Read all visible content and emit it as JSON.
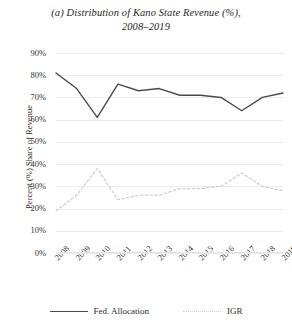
{
  "chart_data": {
    "type": "line",
    "title": "(a) Distribution of Kano State Revenue (%), 2008–2019",
    "title_line1": "(a) Distribution of Kano State Revenue (%),",
    "title_line2": "2008–2019",
    "xlabel": "",
    "ylabel": "Percent (%) Share of Revenue",
    "categories": [
      "2008",
      "2009",
      "2010",
      "2011",
      "2012",
      "2013",
      "2014",
      "2015",
      "2016",
      "2017",
      "2018",
      "2019"
    ],
    "x": [
      2008,
      2009,
      2010,
      2011,
      2012,
      2013,
      2014,
      2015,
      2016,
      2017,
      2018,
      2019
    ],
    "ylim": [
      0,
      90
    ],
    "yticks": [
      0,
      10,
      20,
      30,
      40,
      50,
      60,
      70,
      80,
      90
    ],
    "ytick_labels": [
      "0%",
      "10%",
      "20%",
      "30%",
      "40%",
      "50%",
      "60%",
      "70%",
      "80%",
      "90%"
    ],
    "grid": true,
    "grid_axis": "y",
    "legend_position": "bottom",
    "series": [
      {
        "name": "Fed. Allocation",
        "style": "solid",
        "color": "#4a4a4a",
        "values": [
          81,
          74,
          61,
          76,
          73,
          74,
          71,
          71,
          70,
          64,
          70,
          72
        ]
      },
      {
        "name": "IGR",
        "style": "dotted",
        "color": "#cfcfcf",
        "values": [
          19,
          26,
          38,
          24,
          26,
          26,
          29,
          29,
          30,
          36,
          30,
          28
        ]
      }
    ]
  },
  "legend": {
    "items": [
      {
        "label": "Fed. Allocation",
        "style": "solid"
      },
      {
        "label": "IGR",
        "style": "dotted"
      }
    ]
  }
}
